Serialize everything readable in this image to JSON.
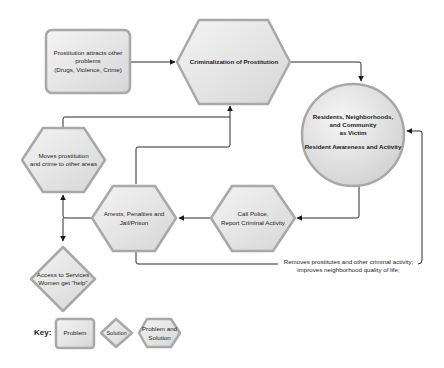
{
  "diagram": {
    "nodes": {
      "problem_box": {
        "text": "Prostitution attracts other\nproblems\n(Drugs, Violence, Crime)",
        "type": "Problem"
      },
      "criminalization": {
        "text": "Criminalization of Prostitution",
        "type": "Problem and Solution"
      },
      "residents": {
        "title": "Residents, Neighborhoods,\nand Community\nas Victim",
        "subtitle": "Resident Awareness and Activity",
        "type": "circle"
      },
      "moves": {
        "text": "Moves prostitution\nand crime to other areas",
        "type": "Problem and Solution"
      },
      "arrests": {
        "text": "Arrests, Penalties and\nJail/Prison",
        "type": "Problem and Solution"
      },
      "call_police": {
        "text": "Call Police,\nReport Criminal Activity",
        "type": "Problem and Solution"
      },
      "access": {
        "text": "Access to Services\nWomen get \"help\"",
        "type": "Solution"
      }
    },
    "edge_labels": {
      "removes": "Removes prostitutes and other criminal activity;\nimproves neighborhood quality of life;"
    },
    "key": {
      "label": "Key:",
      "items": [
        {
          "shape": "rounded-rect",
          "text": "Problem"
        },
        {
          "shape": "diamond",
          "text": "Solution"
        },
        {
          "shape": "hexagon",
          "text": "Problem and\nSolution"
        }
      ]
    },
    "colors": {
      "fill_light": "#f2f2f2",
      "fill_dark": "#d4d4d4",
      "stroke": "#a8a8a8",
      "line": "#2a2a2a"
    }
  }
}
